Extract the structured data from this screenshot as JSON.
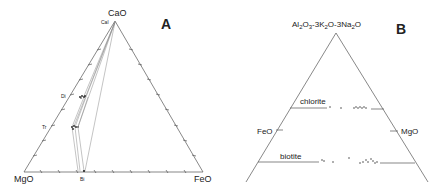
{
  "panel_a": {
    "label": "A",
    "apex_top": "CaO",
    "apex_left": "MgO",
    "apex_right": "FeO",
    "phases": {
      "cal": "Cal",
      "di": "Di",
      "tr": "Tr",
      "bi": "Bi"
    }
  },
  "panel_b": {
    "label": "B",
    "apex_top_parts": [
      "Al",
      "2",
      "O",
      "3",
      "-3K",
      "2",
      "O-3Na",
      "2",
      "O"
    ],
    "left_side": "FeO",
    "right_side": "MgO",
    "tie_lines": {
      "upper": "chlorite",
      "lower": "biotite"
    }
  },
  "colors": {
    "line": "#555555",
    "text": "#222222",
    "background": "#ffffff"
  }
}
